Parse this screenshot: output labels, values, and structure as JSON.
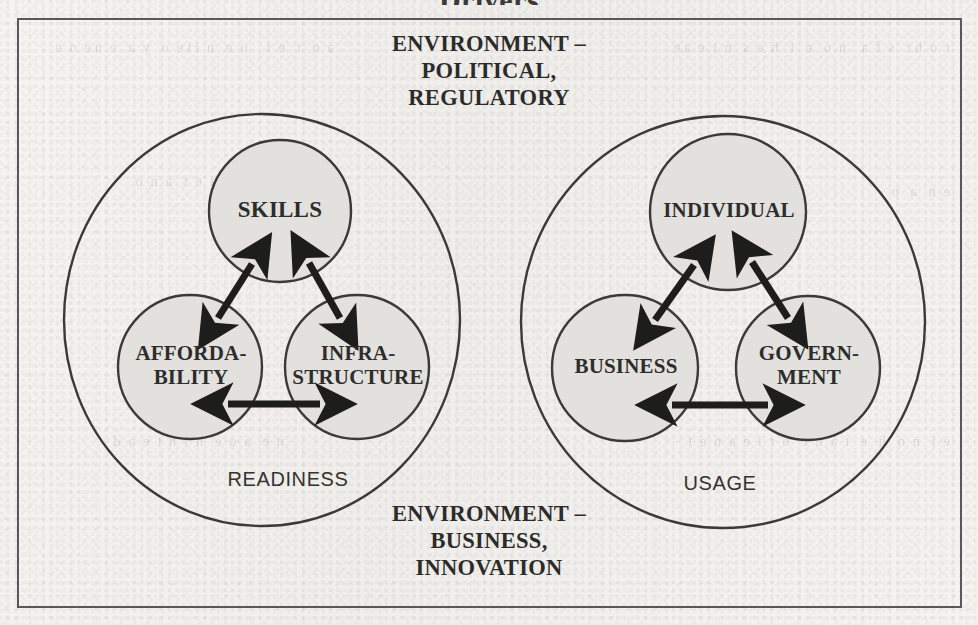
{
  "figure": {
    "title": "Drivers",
    "frame_border_color": "#58585a",
    "paper_color": "#f3f2ef",
    "node_fill_color": "#e2e1de",
    "stroke_color": "#3a3a38",
    "environment_top": "ENVIRONMENT –\nPOLITICAL,\nREGULATORY",
    "environment_bottom": "ENVIRONMENT –\nBUSINESS,\nINNOVATION"
  },
  "groups": [
    {
      "id": "readiness",
      "ring_label": "READINESS",
      "nodes": [
        {
          "id": "skills",
          "label": "SKILLS",
          "position": "top"
        },
        {
          "id": "affordability",
          "label": "AFFORDA-\nBILITY",
          "position": "bottom-left"
        },
        {
          "id": "infrastructure",
          "label": "INFRA-\nSTRUCTURE",
          "position": "bottom-right"
        }
      ],
      "connections": [
        {
          "from": "affordability",
          "to": "skills",
          "type": "double-arrow"
        },
        {
          "from": "skills",
          "to": "infrastructure",
          "type": "double-arrow"
        },
        {
          "from": "affordability",
          "to": "infrastructure",
          "type": "double-arrow"
        }
      ]
    },
    {
      "id": "usage",
      "ring_label": "USAGE",
      "nodes": [
        {
          "id": "individual",
          "label": "INDIVIDUAL",
          "position": "top"
        },
        {
          "id": "business",
          "label": "BUSINESS",
          "position": "bottom-left"
        },
        {
          "id": "government",
          "label": "GOVERN-\nMENT",
          "position": "bottom-right"
        }
      ],
      "connections": [
        {
          "from": "business",
          "to": "individual",
          "type": "double-arrow"
        },
        {
          "from": "individual",
          "to": "government",
          "type": "double-arrow"
        },
        {
          "from": "business",
          "to": "government",
          "type": "double-arrow"
        }
      ]
    }
  ],
  "background_bleed": {
    "top_left": "a  o   t   e  i     o  e   n  i t e  o   y  a   e  n e  o  e",
    "top_right": "r  o  h r   s  f  a    n  o   e   i   h  e  s   n  t  e  a e",
    "mid_left": "i  e  t   a  n  o",
    "mid_right": "e  n   a   o",
    "bottom_left": "n  e   a  o  e   n  i  h  t  e  a  d",
    "bottom_right": "e  i   n  o   h   e   t  a  n  e   o  r  i  e  a  n  e  t"
  }
}
